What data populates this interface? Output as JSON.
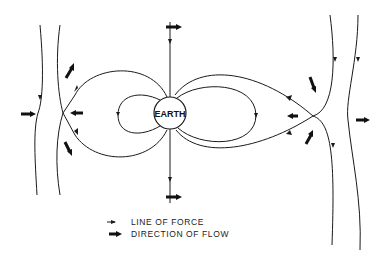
{
  "diagram": {
    "type": "magnetosphere field-line diagram",
    "center_body": {
      "label": "EARTH"
    },
    "legend": [
      {
        "symbol": "small-arrow",
        "label": "LINE OF FORCE"
      },
      {
        "symbol": "bold-arrow",
        "label": "DIRECTION OF FLOW"
      }
    ],
    "colors": {
      "ink": "#1a1a1a",
      "background": "#ffffff"
    }
  }
}
